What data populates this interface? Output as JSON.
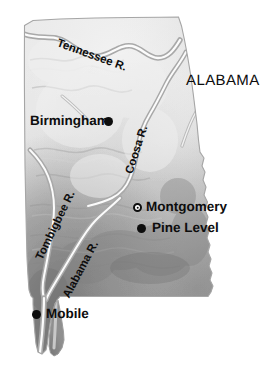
{
  "map": {
    "title": "ALABAMA",
    "state_label": {
      "text": "ALABAMA",
      "x": 186,
      "y": 81
    },
    "cities": [
      {
        "name": "Birmingham",
        "marker": "solid-dot",
        "label_side": "left",
        "dot_x": 108,
        "dot_y": 122,
        "label_x": 30,
        "label_y": 115
      },
      {
        "name": "Montgomery",
        "marker": "capital-circle",
        "label_side": "right",
        "dot_x": 137,
        "dot_y": 207,
        "label_x": 146,
        "label_y": 200
      },
      {
        "name": "Pine Level",
        "marker": "solid-dot",
        "label_side": "right",
        "dot_x": 141,
        "dot_y": 228,
        "label_x": 152,
        "label_y": 221
      },
      {
        "name": "Mobile",
        "marker": "solid-dot",
        "label_side": "right",
        "dot_x": 36,
        "dot_y": 314,
        "label_x": 46,
        "label_y": 307
      }
    ],
    "rivers": [
      {
        "name": "Tennessee R.",
        "x": 57,
        "y": 38,
        "rotation": 20
      },
      {
        "name": "Coosa R.",
        "x": 130,
        "y": 168,
        "rotation": -72
      },
      {
        "name": "Tombigbee R.",
        "x": 40,
        "y": 254,
        "rotation": -64
      },
      {
        "name": "Alabama R.",
        "x": 67,
        "y": 292,
        "rotation": -62
      }
    ],
    "colors": {
      "land_light": "#ebebeb",
      "land_mid": "#c4c4c4",
      "land_dark": "#8e8e8e",
      "land_darkest": "#6e6e6e",
      "outline": "#9a9a9a",
      "river": "#ffffff",
      "text": "#0d0d0d",
      "background": "#ffffff"
    },
    "projection_note": "shaded-relief"
  }
}
